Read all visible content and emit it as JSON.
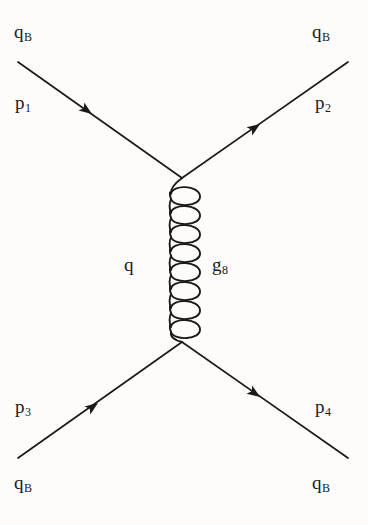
{
  "diagram": {
    "type": "feynman-diagram",
    "background_color": "#fdfcfa",
    "line_color": "#1a1a1a",
    "labels": {
      "incoming_upper_particle": {
        "base": "q",
        "sub": "B"
      },
      "incoming_upper_momentum": {
        "base": "p",
        "sub": "1"
      },
      "outgoing_upper_particle": {
        "base": "q",
        "sub": "B"
      },
      "outgoing_upper_momentum": {
        "base": "p",
        "sub": "2"
      },
      "incoming_lower_particle": {
        "base": "q",
        "sub": "B"
      },
      "incoming_lower_momentum": {
        "base": "p",
        "sub": "3"
      },
      "outgoing_lower_particle": {
        "base": "q",
        "sub": "B"
      },
      "outgoing_lower_momentum": {
        "base": "p",
        "sub": "4"
      },
      "propagator_left": {
        "base": "q",
        "sub": ""
      },
      "propagator_right": {
        "base": "g",
        "sub": "8"
      }
    },
    "geometry": {
      "top_vertex": {
        "x": 182,
        "y": 178
      },
      "bottom_vertex": {
        "x": 182,
        "y": 342
      },
      "upper_left_line": {
        "x1": 18,
        "y1": 62,
        "x2": 182,
        "y2": 178
      },
      "upper_right_line": {
        "x1": 182,
        "y1": 178,
        "x2": 348,
        "y2": 62
      },
      "lower_left_line": {
        "x1": 18,
        "y1": 458,
        "x2": 182,
        "y2": 342
      },
      "lower_right_line": {
        "x1": 182,
        "y1": 342,
        "x2": 348,
        "y2": 458
      },
      "gluon_loops": 8,
      "gluon_loop_width": 28,
      "line_width": 1.6
    },
    "arrows": [
      {
        "name": "arrow-incoming-upper",
        "x": 90,
        "y": 113,
        "angle": 35,
        "direction": "toward-vertex"
      },
      {
        "name": "arrow-outgoing-upper",
        "x": 258,
        "y": 125,
        "angle": -35,
        "direction": "away-from-vertex"
      },
      {
        "name": "arrow-incoming-lower",
        "x": 96,
        "y": 403,
        "angle": -35,
        "direction": "toward-vertex"
      },
      {
        "name": "arrow-outgoing-lower",
        "x": 258,
        "y": 397,
        "angle": 35,
        "direction": "away-from-vertex"
      }
    ]
  }
}
